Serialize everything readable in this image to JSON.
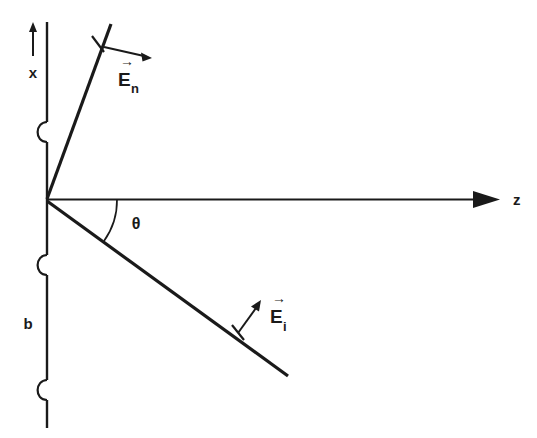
{
  "figure": {
    "background_color": "#ffffff",
    "ink_color": "#1a1a1a",
    "width": 537,
    "height": 438
  },
  "axes": {
    "x_axis": {
      "label": "x",
      "icon": "up-arrow-icon",
      "direction": "up"
    },
    "z_axis": {
      "label": "z",
      "icon": "right-arrow-icon",
      "direction": "right"
    }
  },
  "angle": {
    "symbol": "θ",
    "name": "theta",
    "between": "z-axis and incident ray"
  },
  "boundary": {
    "label": "b",
    "description": "vertical periodic boundary with three bracket bumps",
    "bracket_count": 3
  },
  "vectors": [
    {
      "id": "E_n",
      "base": "E",
      "subscript": "n",
      "overbar": "→",
      "name": "normal-field-vector",
      "on_ray": "reflected"
    },
    {
      "id": "E_i",
      "base": "E",
      "subscript": "i",
      "overbar": "→",
      "name": "incident-field-vector",
      "on_ray": "incident"
    }
  ],
  "rays": [
    {
      "id": "reflected-ray",
      "from": "origin",
      "to": "upper-right"
    },
    {
      "id": "incident-ray",
      "from": "origin",
      "to": "lower-right"
    }
  ]
}
